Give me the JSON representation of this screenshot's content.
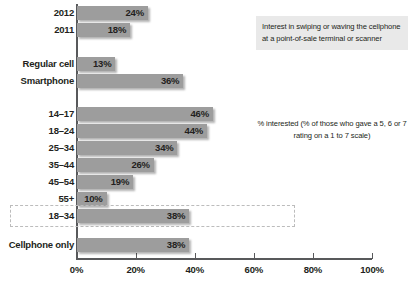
{
  "chart_data": {
    "type": "bar",
    "orientation": "horizontal",
    "title": "Interest in swiping or waving the cellphone at a point-of-sale terminal or scanner",
    "annotation": "% interested (% of those who gave a 5, 6 or 7 rating on a 1 to 7 scale)",
    "xlabel": "",
    "ylabel": "",
    "xlim": [
      0,
      100
    ],
    "grid": false,
    "legend": null,
    "xticks": [
      {
        "value": 0,
        "label": "0%"
      },
      {
        "value": 20,
        "label": "20%"
      },
      {
        "value": 40,
        "label": "40%"
      },
      {
        "value": 60,
        "label": "60%"
      },
      {
        "value": 80,
        "label": "80%"
      },
      {
        "value": 100,
        "label": "100%"
      }
    ],
    "categories": [
      "2012",
      "2011",
      "Regular cell",
      "Smartphone",
      "14–17",
      "18–24",
      "25–34",
      "35–44",
      "45–54",
      "55+",
      "18–34",
      "Cellphone only"
    ],
    "values": [
      24,
      18,
      13,
      36,
      46,
      44,
      34,
      26,
      19,
      10,
      38,
      38
    ],
    "value_labels": [
      "24%",
      "18%",
      "13%",
      "36%",
      "46%",
      "44%",
      "34%",
      "26%",
      "19%",
      "10%",
      "38%",
      "38%"
    ],
    "groups": [
      {
        "name": "year",
        "categories": [
          "2012",
          "2011"
        ]
      },
      {
        "name": "phone-type",
        "categories": [
          "Regular cell",
          "Smartphone"
        ]
      },
      {
        "name": "age",
        "categories": [
          "14–17",
          "18–24",
          "25–34",
          "35–44",
          "45–54",
          "55+",
          "18–34"
        ]
      },
      {
        "name": "service",
        "categories": [
          "Cellphone only"
        ]
      }
    ],
    "highlighted_category": "18–34",
    "bar_color": "#9d9d9d",
    "text_color": "#231f20",
    "title_background": "#e9e9e9"
  },
  "rows": [
    {
      "label": "2012",
      "value": 24,
      "value_label": "24%",
      "top": 6,
      "highlight": false
    },
    {
      "label": "2011",
      "value": 18,
      "value_label": "18%",
      "top": 23,
      "highlight": false
    },
    {
      "label": "Regular cell",
      "value": 13,
      "value_label": "13%",
      "top": 57,
      "highlight": false
    },
    {
      "label": "Smartphone",
      "value": 36,
      "value_label": "36%",
      "top": 74,
      "highlight": false
    },
    {
      "label": "14–17",
      "value": 46,
      "value_label": "46%",
      "top": 107,
      "highlight": false
    },
    {
      "label": "18–24",
      "value": 44,
      "value_label": "44%",
      "top": 124,
      "highlight": false
    },
    {
      "label": "25–34",
      "value": 34,
      "value_label": "34%",
      "top": 141,
      "highlight": false
    },
    {
      "label": "35–44",
      "value": 26,
      "value_label": "26%",
      "top": 158,
      "highlight": false
    },
    {
      "label": "45–54",
      "value": 19,
      "value_label": "19%",
      "top": 175,
      "highlight": false
    },
    {
      "label": "55+",
      "value": 10,
      "value_label": "10%",
      "top": 192,
      "highlight": false
    },
    {
      "label": "18–34",
      "value": 38,
      "value_label": "38%",
      "top": 209,
      "highlight": true
    },
    {
      "label": "Cellphone only",
      "value": 38,
      "value_label": "38%",
      "top": 238,
      "highlight": false
    }
  ]
}
